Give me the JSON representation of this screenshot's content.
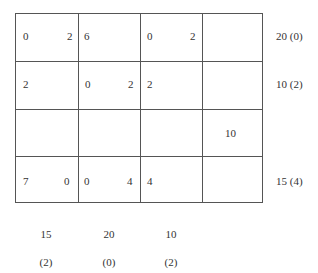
{
  "table": {
    "rows": [
      {
        "cells": [
          {
            "left": "0",
            "right": "2"
          },
          {
            "left": "6",
            "right": ""
          },
          {
            "left": "0",
            "right": "2"
          },
          {
            "left": "",
            "right": ""
          }
        ],
        "label": "20 (0)"
      },
      {
        "cells": [
          {
            "left": "2",
            "right": ""
          },
          {
            "left": "0",
            "right": "2"
          },
          {
            "left": "2",
            "right": ""
          },
          {
            "left": "",
            "right": ""
          }
        ],
        "label": "10 (2)"
      },
      {
        "cells": [
          {
            "left": "",
            "right": ""
          },
          {
            "left": "",
            "right": ""
          },
          {
            "left": "",
            "right": ""
          },
          {
            "left": "10",
            "right": ""
          }
        ],
        "label": ""
      },
      {
        "cells": [
          {
            "left": "7",
            "right": "0"
          },
          {
            "left": "0",
            "right": "4"
          },
          {
            "left": "4",
            "right": ""
          },
          {
            "left": "",
            "right": ""
          }
        ],
        "label": "15 (4)"
      }
    ],
    "column_labels": [
      {
        "value": "15",
        "sub": "(2)"
      },
      {
        "value": "20",
        "sub": "(0)"
      },
      {
        "value": "10",
        "sub": "(2)"
      }
    ]
  }
}
